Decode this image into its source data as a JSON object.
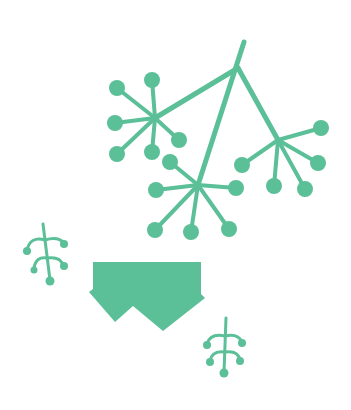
{
  "illustration": {
    "subject": "umbel flower clusters with sprigs and a vase-like shape",
    "colors": {
      "primary": "#5bbf98",
      "background": "#ffffff"
    },
    "elements": [
      {
        "name": "main-umbel-cluster",
        "description": "three branching umbel flower heads on stems"
      },
      {
        "name": "left-sprig",
        "description": "small branching sprig with berry tips"
      },
      {
        "name": "container-shape",
        "description": "flat-topped shape with zigzag bottom edge"
      },
      {
        "name": "bottom-sprig",
        "description": "small branching sprig with berry tips"
      }
    ]
  }
}
